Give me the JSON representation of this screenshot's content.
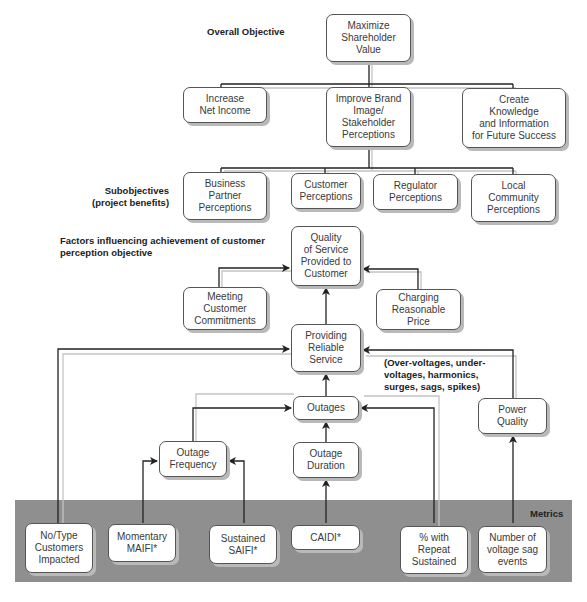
{
  "labels": {
    "overall_objective": "Overall Objective",
    "subobjectives": "Subobjectives\n(project benefits)",
    "factors": "Factors influencing achievement of customer\nperception objective",
    "power_quality_note": "(Over-voltages, under-\nvoltages, harmonics,\nsurges, sags, spikes)",
    "metrics": "Metrics"
  },
  "nodes": {
    "maximize": "Maximize\nShareholder\nValue",
    "net_income": "Increase\nNet Income",
    "brand": "Improve Brand\nImage/\nStakeholder\nPerceptions",
    "knowledge": "Create\nKnowledge\nand Information\nfor Future Success",
    "business_partner": "Business\nPartner\nPerceptions",
    "customer": "Customer\nPerceptions",
    "regulator": "Regulator\nPerceptions",
    "community": "Local\nCommunity\nPerceptions",
    "quality": "Quality\nof Service\nProvided to\nCustomer",
    "meeting": "Meeting\nCustomer\nCommitments",
    "charging": "Charging\nReasonable\nPrice",
    "reliable": "Providing\nReliable\nService",
    "outages": "Outages",
    "power_quality": "Power\nQuality",
    "frequency": "Outage\nFrequency",
    "duration": "Outage\nDuration"
  },
  "metrics": [
    "No/Type\nCustomers\nImpacted",
    "Momentary\nMAIFI*",
    "Sustained\nSAIFI*",
    "CAIDI*",
    "% with\nRepeat\nSustained",
    "Number of\nvoltage sag\nevents"
  ],
  "colors": {
    "band": "#8f8f8f",
    "line": "#222222",
    "shadow_line": "#bbbbbb"
  }
}
